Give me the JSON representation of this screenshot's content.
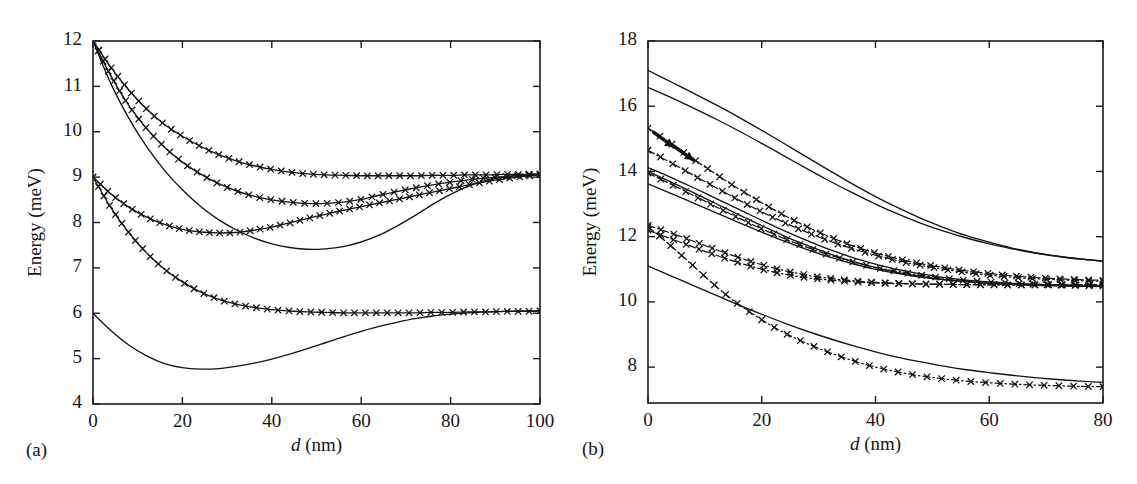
{
  "figure": {
    "background": "#ffffff",
    "ink_color": "#141414",
    "panels": [
      "a",
      "b"
    ]
  },
  "chart_data": [
    {
      "id": "panel-a",
      "type": "line",
      "panel_label": "(a)",
      "title": "",
      "xlabel": "d (nm)",
      "xlabel_italic_part": "d",
      "xlabel_rest": " (nm)",
      "ylabel": "Energy (meV)",
      "xlim": [
        0,
        100
      ],
      "ylim": [
        4,
        12
      ],
      "xticks": [
        0,
        20,
        40,
        60,
        80,
        100
      ],
      "xticklabels": [
        "0",
        "20",
        "40",
        "60",
        "80",
        "100"
      ],
      "yticks": [
        4,
        5,
        6,
        7,
        8,
        9,
        10,
        11,
        12
      ],
      "yticklabels": [
        "4",
        "5",
        "6",
        "7",
        "8",
        "9",
        "10",
        "11",
        "12"
      ],
      "grid": false,
      "legend": "none",
      "marker": "x",
      "series": [
        {
          "name": "level-1-upper-12",
          "style": "solid-marker",
          "x": [
            0,
            4,
            8,
            12,
            16,
            20,
            24,
            28,
            32,
            36,
            40,
            44,
            48,
            52,
            56,
            60,
            64,
            68,
            72,
            76,
            80,
            84,
            88,
            92,
            96,
            100
          ],
          "y": [
            12.0,
            11.42,
            10.92,
            10.5,
            10.16,
            9.9,
            9.68,
            9.5,
            9.36,
            9.25,
            9.17,
            9.11,
            9.07,
            9.05,
            9.04,
            9.03,
            9.03,
            9.03,
            9.03,
            9.04,
            9.04,
            9.05,
            9.05,
            9.06,
            9.06,
            9.07
          ]
        },
        {
          "name": "level-2-upper-12",
          "style": "solid-marker",
          "x": [
            0,
            4,
            8,
            12,
            16,
            20,
            24,
            28,
            32,
            36,
            40,
            44,
            48,
            52,
            56,
            60,
            64,
            68,
            72,
            76,
            80,
            84,
            88,
            92,
            96,
            100
          ],
          "y": [
            12.0,
            11.23,
            10.58,
            10.07,
            9.66,
            9.33,
            9.07,
            8.86,
            8.7,
            8.58,
            8.5,
            8.45,
            8.42,
            8.42,
            8.45,
            8.51,
            8.6,
            8.68,
            8.76,
            8.83,
            8.89,
            8.94,
            8.98,
            9.01,
            9.04,
            9.06
          ]
        },
        {
          "name": "level-3-plain-12",
          "style": "solid",
          "x": [
            0,
            4,
            8,
            12,
            16,
            20,
            24,
            28,
            32,
            36,
            40,
            44,
            48,
            52,
            56,
            60,
            64,
            68,
            72,
            76,
            80,
            84,
            88,
            92,
            96,
            100
          ],
          "y": [
            12.0,
            11.06,
            10.3,
            9.67,
            9.15,
            8.72,
            8.36,
            8.07,
            7.84,
            7.66,
            7.53,
            7.45,
            7.41,
            7.42,
            7.47,
            7.57,
            7.72,
            7.92,
            8.15,
            8.4,
            8.62,
            8.8,
            8.93,
            9.0,
            9.05,
            9.07
          ]
        },
        {
          "name": "level-4-upper-9",
          "style": "solid-marker",
          "x": [
            0,
            4,
            8,
            12,
            16,
            20,
            24,
            28,
            32,
            36,
            40,
            44,
            48,
            52,
            56,
            60,
            64,
            68,
            72,
            76,
            80,
            84,
            88,
            92,
            96,
            100
          ],
          "y": [
            9.0,
            8.63,
            8.34,
            8.12,
            7.96,
            7.85,
            7.79,
            7.77,
            7.78,
            7.83,
            7.9,
            7.99,
            8.09,
            8.18,
            8.27,
            8.35,
            8.43,
            8.51,
            8.59,
            8.67,
            8.75,
            8.83,
            8.9,
            8.96,
            9.01,
            9.05
          ]
        },
        {
          "name": "level-5-lower-9",
          "style": "solid-marker",
          "x": [
            0,
            4,
            8,
            12,
            16,
            20,
            24,
            28,
            32,
            36,
            40,
            44,
            48,
            52,
            56,
            60,
            64,
            68,
            72,
            76,
            80,
            84,
            88,
            92,
            96,
            100
          ],
          "y": [
            9.0,
            8.33,
            7.78,
            7.33,
            6.97,
            6.69,
            6.47,
            6.31,
            6.2,
            6.13,
            6.08,
            6.05,
            6.03,
            6.02,
            6.01,
            6.01,
            6.01,
            6.01,
            6.01,
            6.02,
            6.02,
            6.03,
            6.03,
            6.04,
            6.04,
            6.05
          ]
        },
        {
          "name": "level-6-plain-6",
          "style": "solid",
          "x": [
            0,
            4,
            8,
            12,
            16,
            20,
            24,
            28,
            32,
            36,
            40,
            44,
            48,
            52,
            56,
            60,
            64,
            68,
            72,
            76,
            80,
            84,
            88,
            92,
            96,
            100
          ],
          "y": [
            6.0,
            5.62,
            5.3,
            5.06,
            4.89,
            4.8,
            4.77,
            4.78,
            4.83,
            4.9,
            4.99,
            5.1,
            5.22,
            5.35,
            5.48,
            5.6,
            5.71,
            5.8,
            5.88,
            5.94,
            5.98,
            6.01,
            6.03,
            6.04,
            6.05,
            6.05
          ]
        }
      ]
    },
    {
      "id": "panel-b",
      "type": "line",
      "panel_label": "(b)",
      "title": "",
      "xlabel": "d (nm)",
      "xlabel_italic_part": "d",
      "xlabel_rest": " (nm)",
      "ylabel": "Energy (meV)",
      "xlim": [
        0,
        80
      ],
      "ylim": [
        6.9,
        18
      ],
      "xticks": [
        0,
        20,
        40,
        60,
        80
      ],
      "xticklabels": [
        "0",
        "20",
        "40",
        "60",
        "80"
      ],
      "yticks": [
        8,
        10,
        12,
        14,
        16,
        18
      ],
      "yticklabels": [
        "8",
        "10",
        "12",
        "14",
        "16",
        "18"
      ],
      "grid": false,
      "legend": "none",
      "marker": "x",
      "series": [
        {
          "name": "b-solid-1",
          "style": "solid",
          "x": [
            0,
            4,
            8,
            12,
            16,
            20,
            24,
            28,
            32,
            36,
            40,
            44,
            48,
            52,
            56,
            60,
            64,
            68,
            72,
            76,
            80
          ],
          "y": [
            17.1,
            16.75,
            16.4,
            16.04,
            15.66,
            15.26,
            14.85,
            14.43,
            14.02,
            13.61,
            13.23,
            12.88,
            12.56,
            12.28,
            12.03,
            11.83,
            11.65,
            11.51,
            11.4,
            11.31,
            11.25
          ]
        },
        {
          "name": "b-solid-2",
          "style": "solid",
          "x": [
            0,
            4,
            8,
            12,
            16,
            20,
            24,
            28,
            32,
            36,
            40,
            44,
            48,
            52,
            56,
            60,
            64,
            68,
            72,
            76,
            80
          ],
          "y": [
            16.58,
            16.27,
            15.94,
            15.6,
            15.24,
            14.86,
            14.47,
            14.08,
            13.7,
            13.34,
            13.0,
            12.69,
            12.41,
            12.17,
            11.96,
            11.78,
            11.63,
            11.5,
            11.4,
            11.32,
            11.25
          ]
        },
        {
          "name": "b-dash-15_3",
          "style": "dash-marker",
          "x": [
            0,
            2,
            4,
            6,
            8,
            10,
            12,
            14,
            16,
            20,
            24,
            28,
            32,
            36,
            40,
            44,
            48,
            52,
            56,
            60,
            64,
            68,
            72,
            76,
            80
          ],
          "y": [
            15.33,
            15.1,
            14.86,
            14.62,
            14.38,
            14.14,
            13.91,
            13.68,
            13.46,
            13.04,
            12.65,
            12.3,
            11.99,
            11.72,
            11.5,
            11.32,
            11.17,
            11.05,
            10.95,
            10.87,
            10.8,
            10.75,
            10.71,
            10.68,
            10.66
          ]
        },
        {
          "name": "b-dash-14_65",
          "style": "dash-marker",
          "x": [
            0,
            2,
            4,
            6,
            8,
            10,
            12,
            14,
            16,
            20,
            24,
            28,
            32,
            36,
            40,
            44,
            48,
            52,
            56,
            60,
            64,
            68,
            72,
            76,
            80
          ],
          "y": [
            14.65,
            14.46,
            14.27,
            14.08,
            13.88,
            13.69,
            13.5,
            13.31,
            13.12,
            12.76,
            12.43,
            12.13,
            11.86,
            11.63,
            11.43,
            11.26,
            11.12,
            11.0,
            10.9,
            10.82,
            10.76,
            10.71,
            10.68,
            10.65,
            10.63
          ]
        },
        {
          "name": "b-solid-14_1-thick",
          "style": "solid",
          "x": [
            0,
            4,
            8,
            12,
            16,
            20,
            24,
            28,
            32,
            36,
            40,
            44,
            48,
            52,
            56,
            60,
            64,
            68,
            72,
            76,
            80
          ],
          "y": [
            14.12,
            13.82,
            13.5,
            13.17,
            12.84,
            12.5,
            12.18,
            11.88,
            11.6,
            11.36,
            11.16,
            10.99,
            10.86,
            10.75,
            10.67,
            10.61,
            10.57,
            10.54,
            10.52,
            10.5,
            10.49
          ]
        },
        {
          "name": "b-solid-14_0",
          "style": "solid",
          "x": [
            0,
            4,
            8,
            12,
            16,
            20,
            24,
            28,
            32,
            36,
            40,
            44,
            48,
            52,
            56,
            60,
            64,
            68,
            72,
            76,
            80
          ],
          "y": [
            14.0,
            13.68,
            13.35,
            13.01,
            12.67,
            12.34,
            12.02,
            11.73,
            11.47,
            11.24,
            11.05,
            10.9,
            10.78,
            10.69,
            10.62,
            10.57,
            10.54,
            10.52,
            10.5,
            10.49,
            10.48
          ]
        },
        {
          "name": "b-dash-13_9",
          "style": "dash-marker",
          "x": [
            0,
            2,
            4,
            6,
            8,
            10,
            12,
            14,
            16,
            20,
            24,
            28,
            32,
            36,
            40,
            44,
            48,
            52,
            56,
            60,
            64,
            68,
            72,
            76,
            80
          ],
          "y": [
            13.95,
            13.78,
            13.61,
            13.44,
            13.26,
            13.09,
            12.91,
            12.74,
            12.57,
            12.24,
            11.94,
            11.67,
            11.43,
            11.23,
            11.06,
            10.93,
            10.82,
            10.73,
            10.66,
            10.61,
            10.57,
            10.54,
            10.52,
            10.5,
            10.49
          ]
        },
        {
          "name": "b-solid-13_6",
          "style": "solid",
          "x": [
            0,
            4,
            8,
            12,
            16,
            20,
            24,
            28,
            32,
            36,
            40,
            44,
            48,
            52,
            56,
            60,
            64,
            68,
            72,
            76,
            80
          ],
          "y": [
            13.62,
            13.33,
            13.03,
            12.73,
            12.43,
            12.14,
            11.86,
            11.6,
            11.37,
            11.17,
            11.0,
            10.87,
            10.76,
            10.68,
            10.62,
            10.57,
            10.54,
            10.51,
            10.49,
            10.48,
            10.47
          ]
        },
        {
          "name": "b-dash-12_35",
          "style": "dash-marker",
          "x": [
            0,
            2,
            4,
            6,
            8,
            10,
            12,
            14,
            16,
            20,
            24,
            28,
            32,
            36,
            40,
            44,
            48,
            52,
            56,
            60,
            64,
            68,
            72,
            76,
            80
          ],
          "y": [
            12.35,
            12.23,
            12.11,
            11.99,
            11.86,
            11.73,
            11.6,
            11.48,
            11.36,
            11.14,
            10.96,
            10.82,
            10.72,
            10.65,
            10.6,
            10.57,
            10.55,
            10.54,
            10.53,
            10.52,
            10.52,
            10.52,
            10.52,
            10.52,
            10.52
          ]
        },
        {
          "name": "b-dash-12_2",
          "style": "dash-marker",
          "x": [
            0,
            2,
            4,
            6,
            8,
            10,
            12,
            14,
            16,
            20,
            24,
            28,
            32,
            36,
            40,
            44,
            48,
            52,
            56,
            60,
            64,
            68,
            72,
            76,
            80
          ],
          "y": [
            12.2,
            12.07,
            11.94,
            11.81,
            11.68,
            11.55,
            11.43,
            11.31,
            11.2,
            11.0,
            10.85,
            10.74,
            10.67,
            10.62,
            10.58,
            10.56,
            10.55,
            10.54,
            10.53,
            10.53,
            10.52,
            10.52,
            10.52,
            10.52,
            10.52
          ]
        },
        {
          "name": "b-dash-11_9-descending",
          "style": "dash-marker",
          "x": [
            0,
            2,
            4,
            6,
            8,
            10,
            12,
            14,
            16,
            20,
            24,
            28,
            32,
            36,
            40,
            44,
            48,
            52,
            56,
            60,
            64,
            68,
            72,
            76,
            80
          ],
          "y": [
            12.3,
            12.02,
            11.72,
            11.41,
            11.1,
            10.78,
            10.47,
            10.18,
            9.92,
            9.45,
            9.05,
            8.72,
            8.44,
            8.2,
            8.0,
            7.85,
            7.73,
            7.64,
            7.57,
            7.52,
            7.48,
            7.45,
            7.43,
            7.41,
            7.4
          ]
        },
        {
          "name": "b-solid-11_1",
          "style": "solid",
          "x": [
            0,
            4,
            8,
            12,
            16,
            20,
            24,
            28,
            32,
            36,
            40,
            44,
            48,
            52,
            56,
            60,
            64,
            68,
            72,
            76,
            80
          ],
          "y": [
            11.1,
            10.8,
            10.5,
            10.2,
            9.9,
            9.62,
            9.35,
            9.1,
            8.87,
            8.66,
            8.47,
            8.3,
            8.16,
            8.03,
            7.92,
            7.83,
            7.75,
            7.68,
            7.62,
            7.57,
            7.53
          ]
        }
      ],
      "annotations": [
        {
          "name": "arrow-upper",
          "type": "arrow",
          "x_from": 1.0,
          "y_from": 15.2,
          "x_to": 4.5,
          "y_to": 14.75
        },
        {
          "name": "arrow-lower",
          "type": "arrow",
          "x_from": 4.5,
          "y_from": 14.78,
          "x_to": 8.0,
          "y_to": 14.35
        }
      ]
    }
  ]
}
